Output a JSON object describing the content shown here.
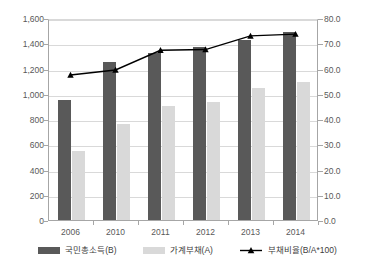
{
  "chart_data": {
    "type": "bar",
    "title": "",
    "subtitle": "",
    "xlabel": "",
    "ylabel": "",
    "categories": [
      "2006",
      "2010",
      "2011",
      "2012",
      "2013",
      "2014"
    ],
    "grid": true,
    "legend_position": "bottom",
    "axes": {
      "left": {
        "min": 0,
        "max": 1600,
        "step": 200,
        "ticks": [
          "0",
          "200",
          "400",
          "600",
          "800",
          "1,000",
          "1,200",
          "1,400",
          "1,600"
        ],
        "tick_values": [
          0,
          200,
          400,
          600,
          800,
          1000,
          1200,
          1400,
          1600
        ]
      },
      "right": {
        "min": 0,
        "max": 80,
        "step": 10,
        "ticks": [
          "0.0",
          "10.0",
          "20.0",
          "30.0",
          "40.0",
          "50.0",
          "60.0",
          "70.0",
          "80.0"
        ],
        "tick_values": [
          0,
          10,
          20,
          30,
          40,
          50,
          60,
          70,
          80
        ]
      }
    },
    "series": [
      {
        "name": "국민총소득(B)",
        "kind": "bar",
        "axis": "left",
        "color": "#595959",
        "values": [
          960,
          1260,
          1330,
          1380,
          1430,
          1500
        ]
      },
      {
        "name": "가계부채(A)",
        "kind": "bar",
        "axis": "left",
        "color": "#d9d9d9",
        "values": [
          555,
          765,
          910,
          945,
          1055,
          1105
        ]
      },
      {
        "name": "부채비율(B/A*100)",
        "kind": "line",
        "axis": "right",
        "color": "#000000",
        "marker": "triangle",
        "values": [
          57.8,
          59.8,
          67.6,
          67.9,
          73.3,
          74.0
        ]
      }
    ]
  },
  "legend": {
    "items": [
      {
        "label": "국민총소득(B)",
        "swatch": "bar-dark-swatch"
      },
      {
        "label": "가계부채(A)",
        "swatch": "bar-light-swatch"
      },
      {
        "label": "부채비율(B/A*100)",
        "swatch": "line-triangle-marker-icon"
      }
    ]
  }
}
